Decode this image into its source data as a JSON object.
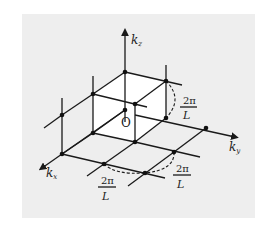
{
  "diagram": {
    "axes": {
      "kz": {
        "label": "k",
        "sub": "z"
      },
      "ky": {
        "label": "k",
        "sub": "y"
      },
      "kx": {
        "label": "k",
        "sub": "x"
      }
    },
    "origin_label": "O",
    "spacing": {
      "numerator": "2π",
      "denominator": "L"
    },
    "colors": {
      "background": "#eeeeee",
      "line": "#1a1a1a",
      "cube_face": "#ffffff"
    }
  }
}
